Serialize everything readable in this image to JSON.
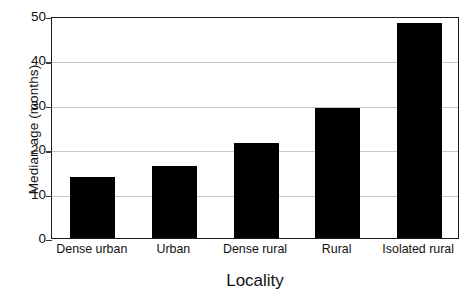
{
  "chart_data": {
    "type": "bar",
    "title": "",
    "xlabel": "Locality",
    "ylabel": "Median age (months)",
    "categories": [
      "Dense urban",
      "Urban",
      "Dense rural",
      "Rural",
      "Isolated rural"
    ],
    "values": [
      13.7,
      16.3,
      21.4,
      29.3,
      48.5
    ],
    "ylim": [
      0,
      50
    ],
    "yticks": [
      0,
      10,
      20,
      30,
      40,
      50
    ],
    "ytick_labels": [
      "0",
      "10",
      "20",
      "30",
      "40",
      "50"
    ],
    "grid": "horizontal",
    "legend": "none",
    "bar_color": "#000000",
    "grid_color": "#c9c9c9",
    "frame_color": "#1c1c1c",
    "background": "#ffffff"
  }
}
